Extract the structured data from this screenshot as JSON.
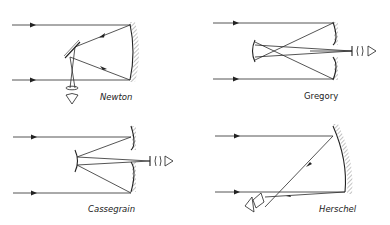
{
  "figure": {
    "panels": [
      {
        "id": "newton",
        "label": "Newton"
      },
      {
        "id": "gregory",
        "label": "Gregory"
      },
      {
        "id": "cassegrain",
        "label": "Cassegrain"
      },
      {
        "id": "herschel",
        "label": "Herschel"
      }
    ]
  },
  "colors": {
    "ink": "#222222",
    "background": "#ffffff"
  }
}
